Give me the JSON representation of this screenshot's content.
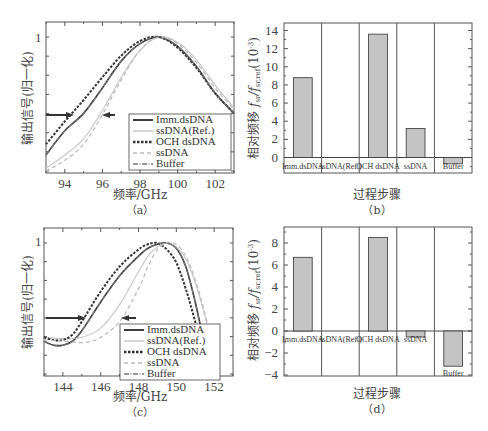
{
  "chart_data": [
    {
      "panel": "a",
      "type": "line",
      "caption": "（a）",
      "xlabel": "频率/GHz",
      "ylabel": "输出信号(归一化)",
      "xlim": [
        93,
        103
      ],
      "xticks": [
        94,
        96,
        98,
        100,
        102
      ],
      "yticks_labeled": [
        {
          "value": 1,
          "label": "1"
        }
      ],
      "legend": [
        "Imm.dsDNA",
        "ssDNA(Ref.)",
        "OCH dsDNA",
        "ssDNA",
        "Buffer"
      ],
      "legend_position": "lower right",
      "annotations": [
        "arrow right at ~94.5 GHz",
        "arrow left at ~96.3 GHz"
      ],
      "series": [
        {
          "name": "Imm.dsDNA",
          "peak_x": 98.9,
          "x": [
            93,
            94,
            95,
            96,
            97,
            98,
            99,
            100,
            101,
            102,
            103
          ],
          "y": [
            0.12,
            0.3,
            0.43,
            0.62,
            0.82,
            0.95,
            1.0,
            0.93,
            0.78,
            0.58,
            0.43
          ]
        },
        {
          "name": "ssDNA(Ref.)",
          "peak_x": 99.2,
          "x": [
            93,
            94,
            95,
            96,
            97,
            98,
            99,
            100,
            101,
            102,
            103
          ],
          "y": [
            0.02,
            0.12,
            0.24,
            0.45,
            0.7,
            0.9,
            1.0,
            0.96,
            0.83,
            0.64,
            0.47
          ]
        },
        {
          "name": "OCH dsDNA",
          "peak_x": 98.7,
          "x": [
            93,
            94,
            95,
            96,
            97,
            98,
            99,
            100,
            101,
            102,
            103
          ],
          "y": [
            0.2,
            0.37,
            0.53,
            0.7,
            0.86,
            0.97,
            1.0,
            0.92,
            0.77,
            0.58,
            0.43
          ]
        },
        {
          "name": "ssDNA",
          "peak_x": 99.0,
          "x": [
            93,
            94,
            95,
            96,
            97,
            98,
            99,
            100,
            101,
            102,
            103
          ],
          "y": [
            0.0,
            0.08,
            0.2,
            0.42,
            0.68,
            0.9,
            1.0,
            0.95,
            0.81,
            0.62,
            0.46
          ]
        },
        {
          "name": "Buffer",
          "peak_x": 98.9,
          "x": [
            93,
            94,
            95,
            96,
            97,
            98,
            99,
            100,
            101,
            102,
            103
          ],
          "y": [
            0.12,
            0.3,
            0.43,
            0.62,
            0.82,
            0.95,
            1.0,
            0.93,
            0.78,
            0.58,
            0.43
          ]
        }
      ]
    },
    {
      "panel": "b",
      "type": "bar",
      "caption": "（b）",
      "xlabel": "过程步骤",
      "ylabel": "相对频移 f_sr/f_sr,ref (10^-3)",
      "ylim": [
        -1.2,
        14.5
      ],
      "yticks": [
        0,
        2,
        4,
        6,
        8,
        10,
        12,
        14
      ],
      "categories": [
        "Imm.dsDNA",
        "ssDNA(Ref.)",
        "OCH dsDNA",
        "ssDNA",
        "Buffer"
      ],
      "values": [
        8.8,
        0,
        13.6,
        3.2,
        -0.7
      ]
    },
    {
      "panel": "c",
      "type": "line",
      "caption": "（c）",
      "xlabel": "频率/GHz",
      "ylabel": "输出信号(归一化)",
      "xlim": [
        143,
        153
      ],
      "xticks": [
        144,
        146,
        148,
        150,
        152
      ],
      "yticks_labeled": [
        {
          "value": 1,
          "label": "1"
        }
      ],
      "legend": [
        "Imm.dsDNA",
        "ssDNA(Ref.)",
        "OCH dsDNA",
        "ssDNA",
        "Buffer"
      ],
      "legend_position": "lower right",
      "annotations": [
        "arrow right at ~145.3 GHz",
        "arrow left at ~147.2 GHz"
      ],
      "series": [
        {
          "name": "Imm.dsDNA",
          "x": [
            143,
            143.5,
            144,
            144.5,
            145,
            146,
            147,
            148,
            148.5,
            149,
            149.5,
            150,
            150.5,
            151,
            151.5,
            151.9
          ],
          "y": [
            0.25,
            0.22,
            0.22,
            0.25,
            0.33,
            0.55,
            0.75,
            0.9,
            0.96,
            0.99,
            1.0,
            0.96,
            0.82,
            0.55,
            0.22,
            0.0
          ]
        },
        {
          "name": "ssDNA(Ref.)",
          "x": [
            143,
            144,
            145,
            146,
            147,
            148,
            148.5,
            149,
            149.5,
            150,
            150.5,
            151,
            151.5,
            152,
            152.3
          ],
          "y": [
            0.28,
            0.27,
            0.28,
            0.35,
            0.53,
            0.78,
            0.9,
            0.97,
            1.0,
            0.97,
            0.88,
            0.7,
            0.45,
            0.15,
            0.0
          ]
        },
        {
          "name": "OCH dsDNA",
          "x": [
            143,
            143.5,
            144,
            144.5,
            145,
            146,
            147,
            148,
            148.5,
            149,
            149.5,
            150,
            150.5,
            151,
            151.5,
            151.8
          ],
          "y": [
            0.28,
            0.26,
            0.26,
            0.3,
            0.4,
            0.63,
            0.82,
            0.95,
            0.99,
            1.0,
            0.95,
            0.85,
            0.65,
            0.4,
            0.12,
            0.0
          ]
        },
        {
          "name": "ssDNA",
          "x": [
            143,
            144,
            145,
            145.5,
            146,
            147,
            148,
            148.5,
            149,
            149.5,
            150,
            150.5,
            151,
            151.5,
            152,
            152.3
          ],
          "y": [
            0.26,
            0.25,
            0.24,
            0.25,
            0.28,
            0.4,
            0.65,
            0.82,
            0.95,
            1.0,
            0.99,
            0.9,
            0.72,
            0.47,
            0.17,
            0.0
          ]
        },
        {
          "name": "Buffer",
          "x": [
            143,
            143.5,
            144,
            144.5,
            145,
            146,
            147,
            148,
            148.5,
            149,
            149.5,
            150,
            150.5,
            151,
            151.5,
            151.9
          ],
          "y": [
            0.25,
            0.22,
            0.22,
            0.25,
            0.33,
            0.55,
            0.75,
            0.9,
            0.96,
            0.99,
            1.0,
            0.96,
            0.82,
            0.55,
            0.22,
            0.0
          ]
        }
      ]
    },
    {
      "panel": "d",
      "type": "bar",
      "caption": "（d）",
      "xlabel": "过程步骤",
      "ylabel": "相对频移 f_sr/f_sr,ref (10^-3)",
      "ylim": [
        -4,
        9.5
      ],
      "yticks": [
        -4,
        -2,
        0,
        2,
        4,
        6,
        8
      ],
      "categories": [
        "Imm.dsDNA",
        "ssDNA(Ref.)",
        "OCH dsDNA",
        "ssDNA",
        "Buffer"
      ],
      "values": [
        6.7,
        0,
        8.5,
        -0.55,
        -3.2
      ]
    }
  ],
  "labels": {
    "freq_axis": "频率/GHz",
    "signal_axis": "输出信号(归一化)",
    "process_axis": "过程步骤",
    "shift_axis_main": "相对频移",
    "shift_axis_unit": "(10",
    "shift_axis_exp": "-3",
    "shift_axis_close": ")",
    "cap_a": "（a）",
    "cap_b": "（b）",
    "cap_c": "（c）",
    "cap_d": "（d）",
    "y_one": "1",
    "bar_labels": [
      "Imm.dsDNA",
      "ssDNA(Ref.)",
      "OCH dsDNA",
      "ssDNA",
      "Buffer"
    ],
    "legend": [
      "Imm.dsDNA",
      "ssDNA(Ref.)",
      "OCH dsDNA",
      "ssDNA",
      "Buffer"
    ]
  },
  "styles": {
    "Imm.dsDNA": {
      "color": "#333333",
      "dash": "",
      "width": 1.6
    },
    "ssDNA(Ref.)": {
      "color": "#c8c8c8",
      "dash": "",
      "width": 1.2
    },
    "OCH dsDNA": {
      "color": "#333333",
      "dash": "2.5,1.5",
      "width": 2
    },
    "ssDNA": {
      "color": "#bbbbbb",
      "dash": "4,3",
      "width": 1.3
    },
    "Buffer": {
      "color": "#777777",
      "dash": "5,1.5,1,1.5",
      "width": 1.2
    },
    "bar_fill": "#c4c4c4",
    "bar_stroke": "#333333"
  }
}
